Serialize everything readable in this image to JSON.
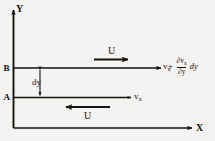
{
  "figure": {
    "background_color": "#f4f3f1",
    "ink_color": "#15120f"
  },
  "axes": {
    "y_label": "Y",
    "x_label": "X"
  },
  "levels": [
    {
      "name": "upper-layer",
      "label": "B"
    },
    {
      "name": "lower-layer",
      "label": "A"
    }
  ],
  "dimension": {
    "label": "dy"
  },
  "flow_arrows": [
    {
      "name": "upper-shear-arrow",
      "label": "U",
      "direction": "right"
    },
    {
      "name": "lower-shear-arrow",
      "label": "U",
      "direction": "left"
    }
  ],
  "velocities": {
    "lower": {
      "symbol": "v",
      "subscript": "x"
    },
    "upper": {
      "symbol": "v",
      "subscript": "x",
      "plus": "+",
      "gradient_numerator_symbol": "∂v",
      "gradient_numerator_subscript": "x",
      "gradient_denominator": "∂y",
      "differential": "dy"
    }
  }
}
